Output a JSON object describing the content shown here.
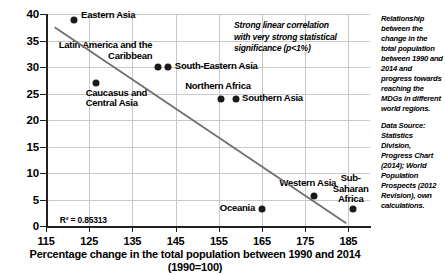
{
  "chart_data": {
    "type": "scatter",
    "title": "",
    "xlabel": "Percentage change in the total population between 1990 and 2014",
    "xlabel_line2": "(1990=100)",
    "ylabel": "",
    "xlim": [
      115,
      190
    ],
    "ylim": [
      0,
      40
    ],
    "xticks": [
      115,
      125,
      135,
      145,
      155,
      165,
      175,
      185
    ],
    "yticks": [
      0,
      5,
      10,
      15,
      20,
      25,
      30,
      35,
      40
    ],
    "grid": true,
    "legend": "none",
    "points": [
      {
        "label": "Eastern Asia",
        "x": 121.5,
        "y": 38.8
      },
      {
        "label": "Caucasus and\nCentral Asia",
        "x": 126.5,
        "y": 27.0
      },
      {
        "label": "Latin America and the\nCaribbean",
        "x": 141.0,
        "y": 30.0
      },
      {
        "label": "South-Eastern Asia",
        "x": 143.2,
        "y": 30.0
      },
      {
        "label": "Northern Africa",
        "x": 155.5,
        "y": 23.9
      },
      {
        "label": "Southern Asia",
        "x": 159.0,
        "y": 24.0
      },
      {
        "label": "Oceania",
        "x": 165.0,
        "y": 3.2
      },
      {
        "label": "Western Asia",
        "x": 177.0,
        "y": 5.7
      },
      {
        "label": "Sub-\nSaharan\nAfrica",
        "x": 186.0,
        "y": 3.2
      }
    ],
    "trendline": {
      "x1": 117.0,
      "y1": 37.5,
      "x2": 184.5,
      "y2": 0.5
    },
    "r_squared_label": "R² = 0.85313",
    "annotation": "Strong linear correlation with very strong statistical significance (p<1%)"
  },
  "caption": {
    "description": "Relationship between the change in the total population between 1990 and 2014 and progress towards reaching the MDGs in different world regions.",
    "source": "Data Source: Statistics Division, Progress Chart (2014); World Population Prospects (2012 Revision), own calculations."
  }
}
